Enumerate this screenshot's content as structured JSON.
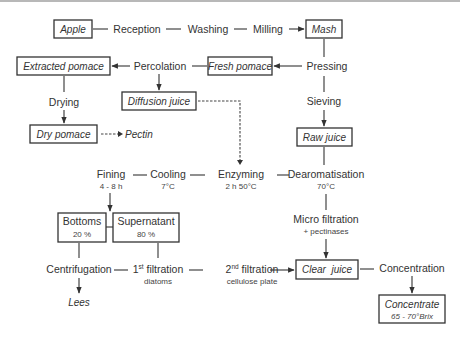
{
  "products": {
    "apple": "Apple",
    "mash": "Mash",
    "extracted_pomace": "Extracted pomace",
    "fresh_pomace": "Fresh pomace",
    "diffusion_juice": "Diffusion juice",
    "dry_pomace": "Dry pomace",
    "pectin": "Pectin",
    "raw_juice": "Raw juice",
    "bottoms": "Bottoms",
    "bottoms_pct": "20 %",
    "supernatant": "Supernatant",
    "supernatant_pct": "80 %",
    "lees": "Lees",
    "clear_juice": "Clear  juice",
    "concentrate": "Concentrate",
    "concentrate_brix": "65 - 70°Brix"
  },
  "steps": {
    "reception": "Reception",
    "washing": "Washing",
    "milling": "Milling",
    "percolation": "Percolation",
    "pressing": "Pressing",
    "sieving": "Sieving",
    "drying": "Drying",
    "fining": "Fining",
    "fining_time": "4 - 8 h",
    "cooling": "Cooling",
    "cooling_temp": "7°C",
    "enzyming": "Enzyming",
    "enzyming_cond": "2 h 50°C",
    "dearomatisation": "Dearomatisation",
    "dearomatisation_temp": "70°C",
    "micro_filtration": "Micro filtration",
    "micro_filtration_note": "+ pectinases",
    "centrifugation": "Centrifugation",
    "filtration1_num": "1",
    "filtration1_sup": "st",
    "filtration1_label": " filtration",
    "filtration1_medium": "diatoms",
    "filtration2_num": "2",
    "filtration2_sup": "nd",
    "filtration2_label": " filtration",
    "filtration2_medium": "cellulose plate",
    "concentration": "Concentration"
  },
  "colors": {
    "line": "#333333",
    "text": "#333333",
    "background": "#ffffff",
    "top_rule": "#b8b8b8"
  }
}
